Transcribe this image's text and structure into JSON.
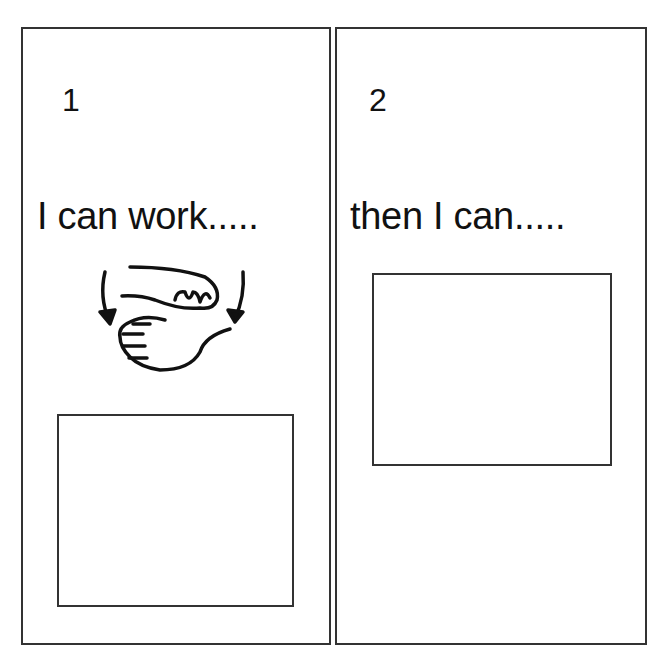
{
  "panels": [
    {
      "number": "1",
      "caption": "I can work.....",
      "symbol": "work-sign-icon",
      "box": "empty-picture-box"
    },
    {
      "number": "2",
      "caption": "then I can.....",
      "box": "empty-picture-box"
    }
  ],
  "colors": {
    "border": "#333333",
    "text": "#111111",
    "background": "#ffffff"
  }
}
